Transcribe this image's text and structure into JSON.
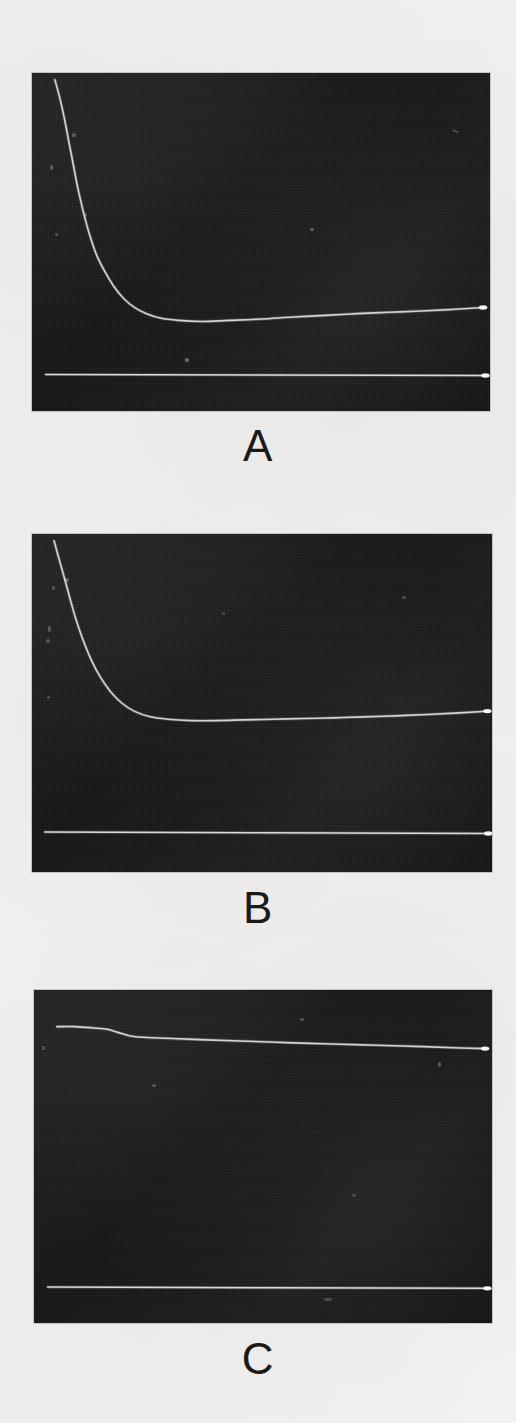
{
  "figure": {
    "background_color": "#f2f1ef",
    "panel_background_color": "#1b1b1b",
    "trace_color": "#e8e6df",
    "label_color": "#1a1a1a",
    "panel_count": 3
  },
  "panels": [
    {
      "label": "A",
      "rect": {
        "x": 32,
        "y": 73,
        "width": 458,
        "height": 338
      },
      "label_y": 424
    },
    {
      "label": "B",
      "rect": {
        "x": 32,
        "y": 534,
        "width": 460,
        "height": 338
      },
      "label_y": 886
    },
    {
      "label": "C",
      "rect": {
        "x": 34,
        "y": 990,
        "width": 458,
        "height": 333
      },
      "label_y": 1337
    }
  ],
  "chart_data": [
    {
      "type": "line",
      "title": "A",
      "xlabel": "",
      "ylabel": "",
      "grid": false,
      "legend": "none",
      "xlim": [
        0,
        1
      ],
      "ylim": [
        0,
        1
      ],
      "notes": "Oscilloscope photograph: decaying signal trace plus flat reference baseline. Signal decays steeply from top-left then plateaus and drifts very slightly upward toward the right edge; terminal bright dot at end of each trace.",
      "series": [
        {
          "name": "signal-trace",
          "x": [
            0.05,
            0.06,
            0.07,
            0.08,
            0.09,
            0.1,
            0.112,
            0.125,
            0.14,
            0.158,
            0.178,
            0.2,
            0.225,
            0.25,
            0.28,
            0.32,
            0.37,
            0.43,
            0.5,
            0.57,
            0.64,
            0.71,
            0.78,
            0.85,
            0.91,
            0.96,
            0.985
          ],
          "y": [
            0.98,
            0.93,
            0.87,
            0.8,
            0.73,
            0.66,
            0.59,
            0.525,
            0.465,
            0.415,
            0.37,
            0.333,
            0.305,
            0.288,
            0.275,
            0.268,
            0.265,
            0.268,
            0.272,
            0.278,
            0.283,
            0.288,
            0.292,
            0.296,
            0.3,
            0.304,
            0.306
          ]
        },
        {
          "name": "baseline-trace",
          "x": [
            0.03,
            0.99
          ],
          "y": [
            0.108,
            0.105
          ]
        }
      ]
    },
    {
      "type": "line",
      "title": "B",
      "xlabel": "",
      "ylabel": "",
      "grid": false,
      "legend": "none",
      "xlim": [
        0,
        1
      ],
      "ylim": [
        0,
        1
      ],
      "notes": "Oscilloscope photograph: decaying signal trace plus flat reference baseline. Decay reaches plateau earlier and at a higher level than panel A; plateau is nearly flat with very slight upward drift and a terminal bright dot.",
      "series": [
        {
          "name": "signal-trace",
          "x": [
            0.048,
            0.058,
            0.07,
            0.082,
            0.095,
            0.11,
            0.128,
            0.148,
            0.17,
            0.195,
            0.222,
            0.255,
            0.295,
            0.345,
            0.4,
            0.46,
            0.525,
            0.59,
            0.655,
            0.72,
            0.79,
            0.86,
            0.92,
            0.97,
            0.99
          ],
          "y": [
            0.98,
            0.93,
            0.872,
            0.812,
            0.75,
            0.69,
            0.63,
            0.578,
            0.535,
            0.5,
            0.476,
            0.46,
            0.452,
            0.448,
            0.448,
            0.45,
            0.452,
            0.454,
            0.456,
            0.459,
            0.462,
            0.466,
            0.47,
            0.474,
            0.476
          ]
        },
        {
          "name": "baseline-trace",
          "x": [
            0.028,
            0.992
          ],
          "y": [
            0.118,
            0.114
          ]
        }
      ]
    },
    {
      "type": "line",
      "title": "C",
      "xlabel": "",
      "ylabel": "",
      "grid": false,
      "legend": "none",
      "xlim": [
        0,
        1
      ],
      "ylim": [
        0,
        1
      ],
      "notes": "Oscilloscope photograph: signal trace stays near the top of the frame with only a small initial step down followed by a very slow linear decline; flat reference baseline far below. Terminal bright dot at right edge.",
      "series": [
        {
          "name": "signal-trace",
          "x": [
            0.05,
            0.09,
            0.13,
            0.16,
            0.185,
            0.21,
            0.24,
            0.29,
            0.36,
            0.45,
            0.55,
            0.65,
            0.75,
            0.85,
            0.93,
            0.985
          ],
          "y": [
            0.89,
            0.89,
            0.886,
            0.882,
            0.872,
            0.862,
            0.858,
            0.855,
            0.851,
            0.847,
            0.842,
            0.838,
            0.834,
            0.83,
            0.826,
            0.824
          ]
        },
        {
          "name": "baseline-trace",
          "x": [
            0.03,
            0.99
          ],
          "y": [
            0.108,
            0.104
          ]
        }
      ]
    }
  ]
}
